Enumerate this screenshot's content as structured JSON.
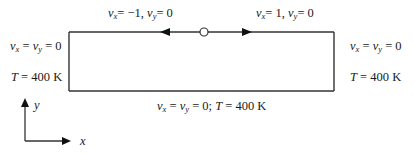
{
  "diagram": {
    "type": "lid-driven cavity boundary conditions",
    "top_left_lid": {
      "vx": "−1",
      "vy": "0",
      "direction": "left"
    },
    "top_right_lid": {
      "vx": "1",
      "vy": "0",
      "direction": "right"
    },
    "left_wall": {
      "velocity": "v_x = v_y = 0",
      "temperature": "T = 400 K"
    },
    "right_wall": {
      "velocity": "v_x = v_y = 0",
      "temperature": "T = 400 K"
    },
    "bottom_wall": {
      "velocity": "v_x = v_y = 0",
      "temperature": "T = 400 K"
    },
    "labels": {
      "top_left_vx_val": "= −1,",
      "top_left_vy_val": "= 0",
      "top_right_vx_val": "= 1,",
      "top_right_vy_val": "= 0",
      "wall_vel_mid": " = ",
      "wall_vel_end": " = 0",
      "temp_symbol": "T",
      "temp_value": " = 400 K",
      "bottom_vel_end": " = 0; ",
      "v": "v",
      "sub_x": "x",
      "sub_y": "y"
    },
    "axes": {
      "x_label": "x",
      "y_label": "y"
    }
  }
}
